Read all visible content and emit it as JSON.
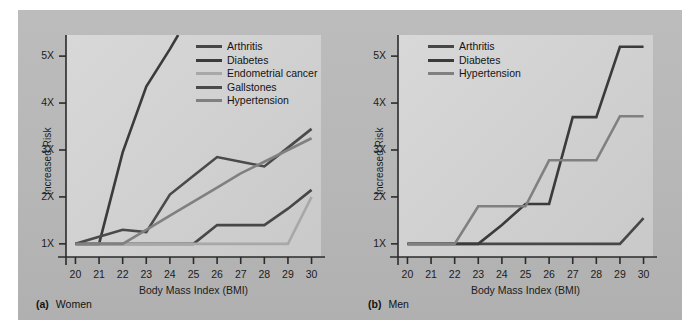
{
  "figure": {
    "background_color": "#b9b9b9",
    "plot_background_color": "#d2d2d2"
  },
  "colors": {
    "arthritis": "#474747",
    "diabetes": "#3b3b3b",
    "endometrial_cancer": "#a8a8a8",
    "gallstones": "#4a4a4a",
    "hypertension": "#808080",
    "axis": "#2b2b2b",
    "text": "#1c1c1c"
  },
  "panels": [
    {
      "id": "women",
      "caption_tag": "(a)",
      "caption_name": "Women",
      "legend_items": [
        {
          "label": "Arthritis",
          "color": "#474747"
        },
        {
          "label": "Diabetes",
          "color": "#3b3b3b"
        },
        {
          "label": "Endometrial cancer",
          "color": "#a8a8a8"
        },
        {
          "label": "Gallstones",
          "color": "#4a4a4a"
        },
        {
          "label": "Hypertension",
          "color": "#808080"
        }
      ]
    },
    {
      "id": "men",
      "caption_tag": "(b)",
      "caption_name": "Men",
      "legend_items": [
        {
          "label": "Arthritis",
          "color": "#474747"
        },
        {
          "label": "Diabetes",
          "color": "#3b3b3b"
        },
        {
          "label": "Hypertension",
          "color": "#808080"
        }
      ]
    }
  ],
  "chart_data": [
    {
      "type": "line",
      "id": "women",
      "title": "(a) Women",
      "xlabel": "Body Mass Index (BMI)",
      "ylabel": "Increased Risk",
      "x": [
        20,
        21,
        22,
        23,
        24,
        25,
        26,
        27,
        28,
        29,
        30
      ],
      "xtick_labels": [
        "20",
        "21",
        "22",
        "23",
        "24",
        "25",
        "26",
        "27",
        "28",
        "29",
        "30"
      ],
      "ytick_values": [
        1,
        2,
        3,
        4,
        5
      ],
      "ytick_labels": [
        "1X",
        "2X",
        "3X",
        "4X",
        "5X"
      ],
      "xlim": [
        19.6,
        30.4
      ],
      "ylim": [
        0.72,
        5.45
      ],
      "grid": false,
      "legend_position": "top-right-inside",
      "series": [
        {
          "name": "Arthritis",
          "color": "#474747",
          "x": [
            20,
            21,
            22,
            23,
            24,
            25,
            26,
            27,
            28,
            29,
            30
          ],
          "values": [
            1.0,
            1.0,
            1.0,
            1.0,
            1.0,
            1.0,
            1.4,
            1.4,
            1.4,
            1.75,
            2.15
          ]
        },
        {
          "name": "Diabetes",
          "color": "#3b3b3b",
          "x": [
            20,
            21,
            22,
            23,
            24,
            24.35
          ],
          "values": [
            1.0,
            1.0,
            2.95,
            4.35,
            5.15,
            5.45
          ]
        },
        {
          "name": "Endometrial cancer",
          "color": "#a8a8a8",
          "x": [
            20,
            21,
            22,
            23,
            24,
            25,
            26,
            27,
            28,
            29,
            30
          ],
          "values": [
            1.0,
            1.0,
            1.0,
            1.0,
            1.0,
            1.0,
            1.0,
            1.0,
            1.0,
            1.0,
            2.0
          ]
        },
        {
          "name": "Gallstones",
          "color": "#4a4a4a",
          "x": [
            20,
            21,
            22,
            23,
            24,
            25,
            26,
            27,
            28,
            29,
            30
          ],
          "values": [
            1.0,
            1.15,
            1.3,
            1.25,
            2.05,
            2.45,
            2.85,
            2.75,
            2.65,
            3.05,
            3.45
          ]
        },
        {
          "name": "Hypertension",
          "color": "#808080",
          "x": [
            20,
            21,
            22,
            23,
            24,
            25,
            26,
            27,
            28,
            29,
            30
          ],
          "values": [
            1.0,
            1.0,
            1.0,
            1.3,
            1.6,
            1.9,
            2.2,
            2.5,
            2.75,
            3.0,
            3.25
          ]
        }
      ]
    },
    {
      "type": "line",
      "id": "men",
      "title": "(b) Men",
      "xlabel": "Body Mass Index (BMI)",
      "ylabel": "Increased Risk",
      "x": [
        20,
        21,
        22,
        23,
        24,
        25,
        26,
        27,
        28,
        29,
        30
      ],
      "xtick_labels": [
        "20",
        "21",
        "22",
        "23",
        "24",
        "25",
        "26",
        "27",
        "28",
        "29",
        "30"
      ],
      "ytick_values": [
        1,
        2,
        3,
        4,
        5
      ],
      "ytick_labels": [
        "1X",
        "2X",
        "3X",
        "4X",
        "5X"
      ],
      "xlim": [
        19.6,
        30.4
      ],
      "ylim": [
        0.72,
        5.45
      ],
      "grid": false,
      "legend_position": "top-left-inside",
      "series": [
        {
          "name": "Arthritis",
          "color": "#474747",
          "x": [
            20,
            21,
            22,
            23,
            24,
            25,
            26,
            27,
            28,
            29,
            30
          ],
          "values": [
            1.0,
            1.0,
            1.0,
            1.0,
            1.0,
            1.0,
            1.0,
            1.0,
            1.0,
            1.0,
            1.55
          ]
        },
        {
          "name": "Diabetes",
          "color": "#3b3b3b",
          "x": [
            20,
            21,
            22,
            23,
            24,
            25,
            26,
            27,
            28,
            29,
            30
          ],
          "values": [
            1.0,
            1.0,
            1.0,
            1.0,
            1.4,
            1.85,
            1.85,
            3.7,
            3.7,
            5.2,
            5.2
          ]
        },
        {
          "name": "Hypertension",
          "color": "#808080",
          "x": [
            20,
            21,
            22,
            23,
            24,
            25,
            26,
            27,
            28,
            29,
            30
          ],
          "values": [
            1.0,
            1.0,
            1.0,
            1.8,
            1.8,
            1.8,
            2.78,
            2.78,
            2.78,
            3.72,
            3.72
          ]
        }
      ]
    }
  ]
}
